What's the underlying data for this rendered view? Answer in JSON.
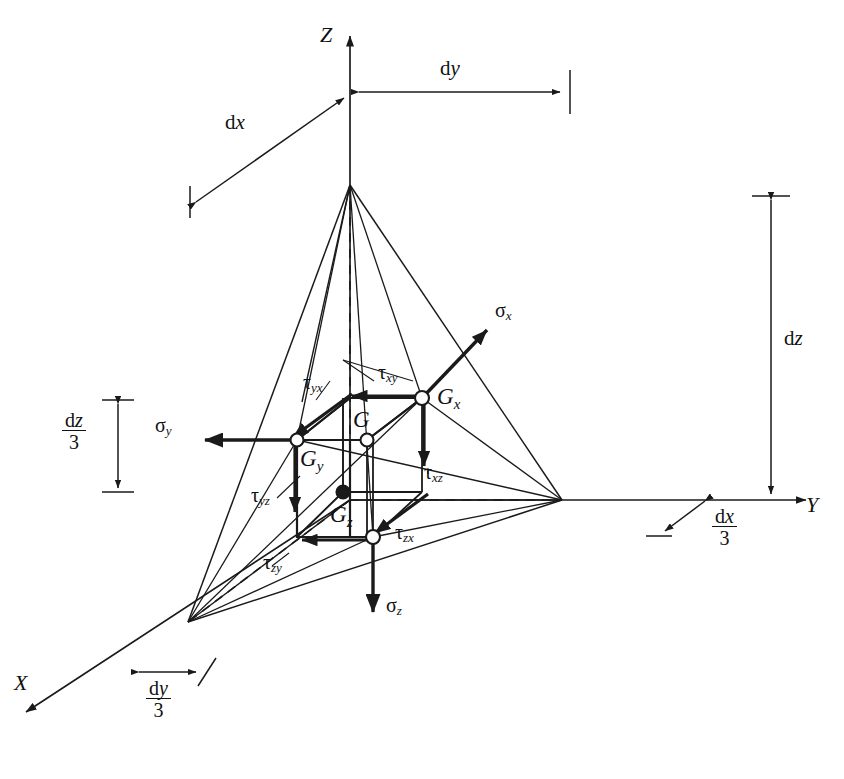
{
  "figure": {
    "type": "engineering-diagram",
    "background_color": "#ffffff",
    "line_color": "#1a1a1a"
  },
  "axes": [
    {
      "id": "z",
      "label": "Z",
      "direction": "up",
      "origin": [
        350,
        500
      ],
      "tip": [
        350,
        28
      ]
    },
    {
      "id": "y",
      "label": "Y",
      "direction": "right",
      "origin": [
        350,
        500
      ],
      "tip": [
        812,
        500
      ]
    },
    {
      "id": "x",
      "label": "X",
      "direction": "down-left",
      "origin": [
        350,
        500
      ],
      "tip": [
        18,
        718
      ]
    }
  ],
  "dimensions": [
    {
      "id": "dx",
      "label": "dx",
      "italic_part": "x",
      "kind": "plain",
      "orientation": "diagonal"
    },
    {
      "id": "dy",
      "label": "dy",
      "italic_part": "y",
      "kind": "plain",
      "orientation": "horizontal"
    },
    {
      "id": "dz",
      "label": "dz",
      "italic_part": "z",
      "kind": "plain",
      "orientation": "vertical"
    },
    {
      "id": "dz_over_3",
      "numerator": "dz",
      "denominator": "3",
      "kind": "fraction",
      "orientation": "vertical"
    },
    {
      "id": "dx_over_3",
      "numerator": "dx",
      "denominator": "3",
      "kind": "fraction",
      "orientation": "diagonal"
    },
    {
      "id": "dy_over_3",
      "numerator": "dy",
      "denominator": "3",
      "kind": "fraction",
      "orientation": "diagonal"
    }
  ],
  "normal_stresses": [
    {
      "id": "sigma_x",
      "symbol": "σ",
      "sub": "x",
      "direction": "up-right",
      "arrow_from": [
        422,
        398
      ],
      "arrow_to": [
        492,
        326
      ]
    },
    {
      "id": "sigma_y",
      "symbol": "σ",
      "sub": "y",
      "direction": "left",
      "arrow_from": [
        297,
        440
      ],
      "arrow_to": [
        196,
        440
      ]
    },
    {
      "id": "sigma_z",
      "symbol": "σ",
      "sub": "z",
      "direction": "down",
      "arrow_from": [
        373,
        537
      ],
      "arrow_to": [
        373,
        625
      ]
    }
  ],
  "shear_stresses": [
    {
      "id": "tau_xy",
      "symbol": "τ",
      "sub": "xy",
      "face": "x",
      "along": "y"
    },
    {
      "id": "tau_xz",
      "symbol": "τ",
      "sub": "xz",
      "face": "x",
      "along": "z"
    },
    {
      "id": "tau_yx",
      "symbol": "τ",
      "sub": "yx",
      "face": "y",
      "along": "x"
    },
    {
      "id": "tau_yz",
      "symbol": "τ",
      "sub": "yz",
      "face": "y",
      "along": "z"
    },
    {
      "id": "tau_zx",
      "symbol": "τ",
      "sub": "zx",
      "face": "z",
      "along": "x"
    },
    {
      "id": "tau_zy",
      "symbol": "τ",
      "sub": "zy",
      "face": "z",
      "along": "y"
    }
  ],
  "points": [
    {
      "id": "G",
      "label": "G",
      "sub": "",
      "marker": "open-circle",
      "pos": [
        367,
        440
      ]
    },
    {
      "id": "Gx",
      "label": "G",
      "sub": "x",
      "marker": "open-circle",
      "pos": [
        422,
        398
      ]
    },
    {
      "id": "Gy",
      "label": "G",
      "sub": "y",
      "marker": "open-circle",
      "pos": [
        297,
        440
      ]
    },
    {
      "id": "Gz",
      "label": "G",
      "sub": "z",
      "marker": "filled-circle",
      "pos": [
        343,
        492
      ]
    },
    {
      "id": "Gv",
      "label": "",
      "sub": "",
      "marker": "open-circle",
      "pos": [
        373,
        537
      ]
    }
  ],
  "labels": {
    "axis_z": "Z",
    "axis_y": "Y",
    "axis_x": "X",
    "dx": "d",
    "dx_it": "x",
    "dy": "d",
    "dy_it": "y",
    "dz": "d",
    "dz_it": "z",
    "three": "3",
    "sigma": "σ",
    "tau": "τ",
    "sub_x": "x",
    "sub_y": "y",
    "sub_z": "z",
    "sub_xy": "xy",
    "sub_xz": "xz",
    "sub_yx": "yx",
    "sub_yz": "yz",
    "sub_zx": "zx",
    "sub_zy": "zy",
    "G": "G"
  }
}
